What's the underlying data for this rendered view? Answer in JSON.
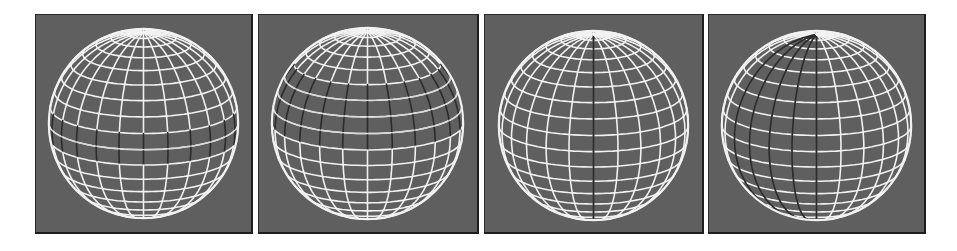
{
  "figure": {
    "background": "#ffffff",
    "panel_background": "#5f5f5f",
    "wire_color": "#f2f2f2",
    "highlight_wire_color": "#2b2b2b",
    "panels": [
      {
        "id": "panel-1",
        "description": "sphere with dark latitude band at equator",
        "left": 35,
        "width": 218,
        "sphere": {
          "cx": 109,
          "cy": 110,
          "r": 96
        },
        "meridians": 24,
        "parallels": 18,
        "highlight": {
          "type": "latitude-band",
          "from": 8,
          "to": 10
        }
      },
      {
        "id": "panel-2",
        "description": "sphere with wide dark latitude band above equator",
        "left": 258,
        "width": 221,
        "sphere": {
          "cx": 110,
          "cy": 110,
          "r": 97
        },
        "meridians": 24,
        "parallels": 18,
        "highlight": {
          "type": "latitude-band",
          "from": 5,
          "to": 9
        }
      },
      {
        "id": "panel-3",
        "description": "sphere with single dark meridian at center",
        "left": 484,
        "width": 220,
        "sphere": {
          "cx": 110,
          "cy": 112,
          "r": 96
        },
        "meridians": 24,
        "parallels": 18,
        "highlight": {
          "type": "meridian-strip",
          "from": 0,
          "to": 0
        }
      },
      {
        "id": "panel-4",
        "description": "sphere with wide dark longitude strip left of center",
        "left": 708,
        "width": 218,
        "sphere": {
          "cx": 109,
          "cy": 112,
          "r": 96
        },
        "meridians": 24,
        "parallels": 18,
        "highlight": {
          "type": "meridian-strip",
          "from": -4,
          "to": 0
        }
      }
    ]
  }
}
